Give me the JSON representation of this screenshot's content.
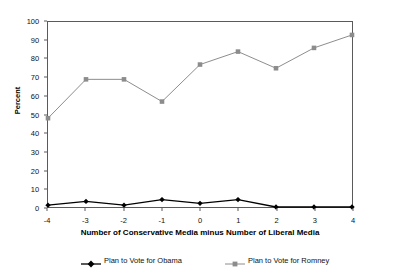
{
  "chart_data": {
    "type": "line",
    "title": "",
    "xlabel": "Number of Conservative Media minus Number of Liberal Media",
    "ylabel": "Percent",
    "x": [
      -4,
      -3,
      -2,
      -1,
      0,
      1,
      2,
      3,
      4
    ],
    "xtick_labels": [
      "-4",
      "-3",
      "-2",
      "-1",
      "0",
      "1",
      "2",
      "3",
      "4"
    ],
    "ytick_labels": [
      "0",
      "10",
      "20",
      "30",
      "40",
      "50",
      "60",
      "70",
      "80",
      "90",
      "100"
    ],
    "ytick_values": [
      0,
      10,
      20,
      30,
      40,
      50,
      60,
      70,
      80,
      90,
      100
    ],
    "xlim": [
      -4,
      4
    ],
    "ylim": [
      0,
      100
    ],
    "grid": false,
    "legend_position": "below",
    "series": [
      {
        "name": "Plan to Vote for Obama",
        "color": "#000000",
        "marker": "diamond",
        "values": [
          1,
          3,
          1,
          4,
          2,
          4,
          0,
          0,
          0
        ]
      },
      {
        "name": "Plan to Vote for Romney",
        "color": "#8c8c8c",
        "marker": "square",
        "values": [
          48,
          69,
          69,
          57,
          77,
          84,
          75,
          86,
          93
        ]
      }
    ]
  },
  "legend": {
    "items": [
      {
        "label": "Plan to Vote for Obama"
      },
      {
        "label": "Plan to Vote for Romney"
      }
    ]
  },
  "axes": {
    "y_title": "Percent",
    "x_title": "Number of Conservative Media minus Number of Liberal Media"
  }
}
